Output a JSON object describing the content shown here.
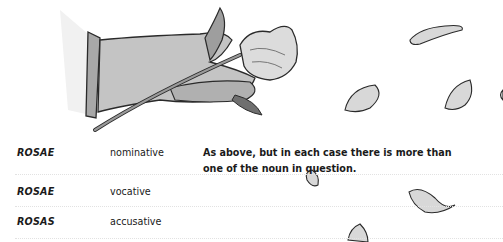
{
  "table": {
    "rows": [
      {
        "word": "ROSAE",
        "case": "nominative",
        "description": "As above, but in each case there is more than one of the noun in question."
      },
      {
        "word": "ROSAE",
        "case": "vocative",
        "description": ""
      },
      {
        "word": "ROSAS",
        "case": "accusative",
        "description": ""
      }
    ]
  },
  "illustration": {
    "subject": "hand holding a rose with falling petals",
    "petal_count": 7,
    "colors": {
      "skin": "#bdbdbd",
      "outline": "#2a2a2a",
      "petal": "#d8d8d8",
      "petal_shade": "#9a9a9a"
    }
  }
}
